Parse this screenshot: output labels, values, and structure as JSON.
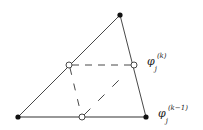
{
  "diagram": {
    "title": "",
    "colors": {
      "stroke": "#333333",
      "fill_vertex": "#111111",
      "background": "#ffffff"
    },
    "vertices": [
      {
        "id": "top",
        "x": 120,
        "y": 15,
        "style": "filled"
      },
      {
        "id": "bottom-left",
        "x": 18,
        "y": 117,
        "style": "filled"
      },
      {
        "id": "bottom-right",
        "x": 146,
        "y": 117,
        "style": "filled"
      }
    ],
    "nodes": [
      {
        "id": "left-mid",
        "x": 69,
        "y": 65,
        "style": "open"
      },
      {
        "id": "right-mid",
        "x": 134,
        "y": 65,
        "style": "open"
      },
      {
        "id": "bottom-mid",
        "x": 82,
        "y": 117,
        "style": "open"
      }
    ],
    "labels": {
      "upper": {
        "base": "φ",
        "sub": "j",
        "sup": "(k)"
      },
      "lower": {
        "base": "φ",
        "sub": "j",
        "sup": "(k−1)"
      }
    }
  }
}
